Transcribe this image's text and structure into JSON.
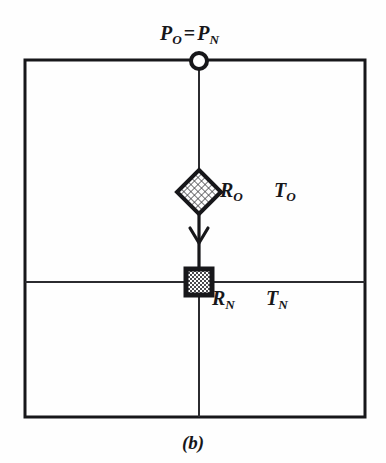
{
  "figure": {
    "caption": "(b)",
    "background_color": "#fefefe",
    "ink_color": "#17171a"
  },
  "diagram": {
    "type": "node-link-diagram",
    "outer_rectangle": {
      "x": 25,
      "y": 60,
      "width": 340,
      "height": 357,
      "stroke_width": 3
    },
    "horizontal_divider": {
      "y": 282,
      "x_start": 25,
      "x_end": 365,
      "stroke_width": 2
    },
    "vertical_line": {
      "x": 199,
      "y_start": 60,
      "y_end": 417,
      "stroke_width": 2
    },
    "nodes": [
      {
        "id": "p-node",
        "shape": "circle",
        "cx": 199,
        "cy": 61,
        "radius": 8,
        "fill": "#ffffff",
        "stroke": "#17171a",
        "stroke_width": 4,
        "label": "P_O = P_N"
      },
      {
        "id": "r-o-node",
        "shape": "diamond",
        "cx": 199,
        "cy": 192,
        "half_size": 22,
        "fill": "crosshatch",
        "stroke": "#17171a",
        "stroke_width": 4,
        "label": "R_O"
      },
      {
        "id": "r-n-node",
        "shape": "square",
        "cx": 199,
        "cy": 282,
        "size": 26,
        "fill": "checkerboard",
        "stroke": "#17171a",
        "stroke_width": 5,
        "label": "R_N"
      }
    ],
    "arrow": {
      "from": "r-o-node",
      "to": "r-n-node",
      "x": 199,
      "y_start": 214,
      "y_end": 269,
      "direction": "down"
    }
  },
  "labels": {
    "top": {
      "symbol": "P",
      "sub_left": "O",
      "operator": "=",
      "symbol_right": "P",
      "sub_right": "N"
    },
    "r_o": {
      "symbol": "R",
      "sub": "O"
    },
    "t_o": {
      "symbol": "T",
      "sub": "O"
    },
    "r_n": {
      "symbol": "R",
      "sub": "N"
    },
    "t_n": {
      "symbol": "T",
      "sub": "N"
    }
  }
}
